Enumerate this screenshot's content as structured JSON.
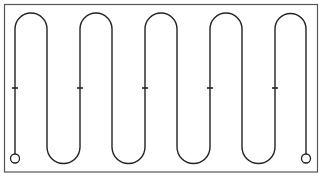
{
  "diagram": {
    "type": "serpentine-path",
    "colors": {
      "stroke": "#222222",
      "frame": "#555555",
      "background": "#ffffff"
    },
    "frame": {
      "x": 4.5,
      "y": 4.5,
      "width": 313,
      "height": 167.5
    },
    "path": {
      "top_y": 29,
      "bottom_y": 147,
      "arc_radius": 16,
      "columns_x": [
        15,
        47,
        80,
        112,
        145,
        177,
        210,
        242,
        275,
        306
      ],
      "start": {
        "x": 15,
        "y": 154
      },
      "end": {
        "x": 306,
        "y": 154
      }
    },
    "terminals": [
      {
        "name": "start-terminal",
        "cx": 15,
        "cy": 158.5,
        "r": 4.5
      },
      {
        "name": "end-terminal",
        "cx": 306,
        "cy": 158.5,
        "r": 4.5
      }
    ],
    "direction_ticks": {
      "y": 88,
      "half_width": 3,
      "x": [
        15,
        80,
        145,
        210,
        275
      ]
    }
  }
}
